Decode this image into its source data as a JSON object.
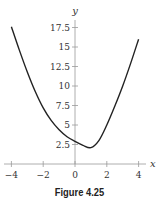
{
  "chart_data": {
    "type": "line",
    "title": "",
    "xlabel": "x",
    "ylabel": "y",
    "xlim": [
      -4.3,
      4.3
    ],
    "ylim": [
      0,
      18.5
    ],
    "xticks": [
      -4,
      -2,
      0,
      2,
      4
    ],
    "xtick_labels": [
      "−4",
      "−2",
      "0",
      "2",
      "4"
    ],
    "yticks": [
      2.5,
      5,
      7.5,
      10,
      12.5,
      15,
      17.5
    ],
    "ytick_labels": [
      "2.5",
      "5",
      "7.5",
      "10",
      "12.5",
      "15",
      "17.5"
    ],
    "grid": false,
    "legend": null,
    "series": [
      {
        "name": "curve",
        "color": "#222222",
        "x": [
          -4,
          -3.5,
          -3,
          -2.5,
          -2,
          -1.5,
          -1,
          -0.5,
          0,
          0.5,
          1,
          1.5,
          2,
          2.5,
          3,
          3.5,
          4
        ],
        "y": [
          17.6,
          14.6,
          11.8,
          9.3,
          7.2,
          5.6,
          4.4,
          3.5,
          2.9,
          2.4,
          2.1,
          3.0,
          5.0,
          7.4,
          10.0,
          12.9,
          16.0
        ]
      }
    ]
  },
  "caption": "Figure 4.25"
}
